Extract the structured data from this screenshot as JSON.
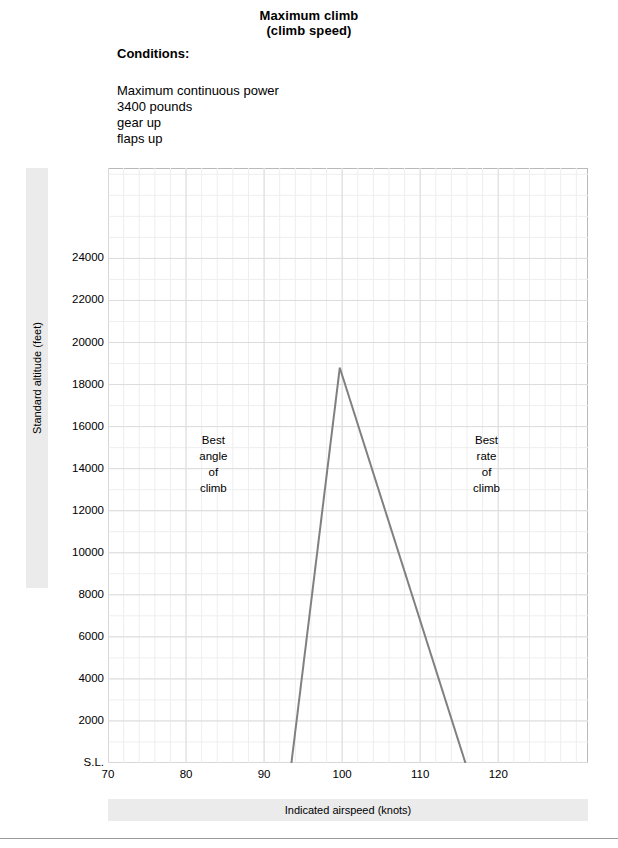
{
  "header": {
    "title_line1": "Maximum climb",
    "title_line2": "(climb speed)",
    "conditions_heading": "Conditions:",
    "conditions": [
      "Maximum continuous power",
      "3400 pounds",
      "gear up",
      "flaps up"
    ]
  },
  "chart_data": {
    "type": "line",
    "title": "Maximum climb (climb speed)",
    "subtitle": "(climb speed)",
    "xlabel": "Indicated airspeed (knots)",
    "ylabel": "Standard altitude (feet)",
    "xlim": [
      70,
      131.5
    ],
    "ylim": [
      0,
      28300
    ],
    "xticks": [
      70,
      80,
      90,
      100,
      110,
      120
    ],
    "xticklabels": [
      "70",
      "80",
      "90",
      "100",
      "110",
      "120"
    ],
    "yticks": [
      0,
      2000,
      4000,
      6000,
      8000,
      10000,
      12000,
      14000,
      16000,
      18000,
      20000,
      22000,
      24000
    ],
    "yticklabels": [
      "S.L.",
      "2000",
      "4000",
      "6000",
      "8000",
      "10000",
      "12000",
      "14000",
      "16000",
      "18000",
      "20000",
      "22000",
      "24000"
    ],
    "grid": true,
    "minor_grid": true,
    "x_minor_step": 2,
    "y_minor_step": 1000,
    "legend": "none",
    "line_color": "#808080",
    "line_width": 2,
    "series": [
      {
        "name": "Best angle of climb (left limb)",
        "x": [
          93.5,
          99.7
        ],
        "y": [
          0,
          18800
        ]
      },
      {
        "name": "Best rate of climb (right limb)",
        "x": [
          99.7,
          115.8
        ],
        "y": [
          18800,
          0
        ]
      }
    ],
    "peak": {
      "x": 99.7,
      "y": 18800
    },
    "annotations": [
      {
        "name": "best-angle-of-climb",
        "lines": [
          "Best",
          "angle",
          "of",
          "climb"
        ],
        "x": 83.5,
        "y": 14200
      },
      {
        "name": "best-rate-of-climb",
        "lines": [
          "Best",
          "rate",
          "of",
          "climb"
        ],
        "x": 118.5,
        "y": 14200
      }
    ]
  },
  "colors": {
    "band": "#ebebeb",
    "frame": "#b9b9b9",
    "grid_major": "#dcdcdc",
    "grid_minor": "#eeeeee",
    "curve": "#808080",
    "rule": "#9a9a9a"
  }
}
